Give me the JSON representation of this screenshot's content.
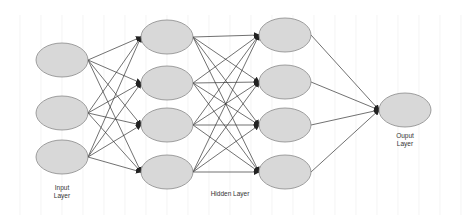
{
  "diagram": {
    "type": "feed-forward neural network",
    "colors": {
      "background": "#ffffff",
      "grid": "#ececec",
      "node_fill": "#d8d8d8",
      "node_stroke": "#8a8a8a",
      "edge": "#333333",
      "label": "#333333"
    },
    "layers": [
      {
        "name": "input",
        "label_lines": [
          "Input",
          "Layer"
        ],
        "label_pos": [
          62,
          190
        ],
        "nodes": [
          {
            "cx": 62,
            "cy": 60
          },
          {
            "cx": 62,
            "cy": 113
          },
          {
            "cx": 62,
            "cy": 157
          }
        ]
      },
      {
        "name": "hidden1",
        "label_lines": [],
        "nodes": [
          {
            "cx": 167,
            "cy": 37
          },
          {
            "cx": 167,
            "cy": 83
          },
          {
            "cx": 167,
            "cy": 125
          },
          {
            "cx": 167,
            "cy": 172
          }
        ]
      },
      {
        "name": "hidden2",
        "label_lines": [],
        "nodes": [
          {
            "cx": 285,
            "cy": 35
          },
          {
            "cx": 285,
            "cy": 82
          },
          {
            "cx": 285,
            "cy": 125
          },
          {
            "cx": 285,
            "cy": 172
          }
        ]
      },
      {
        "name": "output",
        "label_lines": [
          "Ouput",
          "Layer"
        ],
        "label_pos": [
          405,
          138
        ],
        "nodes": [
          {
            "cx": 405,
            "cy": 110
          }
        ]
      }
    ],
    "shared_labels": [
      {
        "text": "Hidden Layer",
        "pos": [
          230,
          196
        ]
      }
    ],
    "node_rx": 26,
    "node_ry": 17,
    "edges": "fully-connected between consecutive layers, arrow heads on target"
  }
}
